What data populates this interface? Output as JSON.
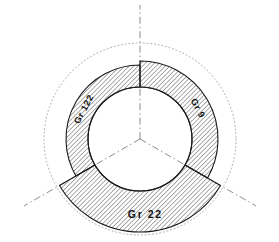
{
  "drawing": {
    "title": "Three-sector annular cross-section",
    "type": "engineering-cross-section",
    "canvas": {
      "width": 279,
      "height": 242,
      "background": "#ffffff"
    },
    "center": {
      "x": 140,
      "y": 139
    },
    "inner_radius": 52,
    "reference_circle": {
      "name": "dotted-reference-circle",
      "radius": 96,
      "style": "dotted",
      "color": "#999999"
    },
    "centerlines": {
      "name": "radial-centerlines",
      "style": "dash-dot",
      "color": "#777777",
      "count": 3,
      "angles_deg": [
        270,
        30,
        150
      ],
      "length": 134
    },
    "hatch": {
      "angle_deg": 45,
      "spacing": 3.2,
      "color": "#222222",
      "line_width": 0.75
    },
    "outline_color": "#1a1a1a",
    "sectors": [
      {
        "id": "sector-gr-122",
        "label": "Gr 122",
        "start_deg": 150,
        "end_deg": 270,
        "outer_radius": 74,
        "label_angle_deg": 208,
        "label_radius": 63,
        "label_rotation_deg": -62
      },
      {
        "id": "sector-gr-9",
        "label": "Gr 9",
        "start_deg": 270,
        "end_deg": 30,
        "outer_radius": 78,
        "label_angle_deg": 332,
        "label_radius": 65,
        "label_rotation_deg": 62
      },
      {
        "id": "sector-gr-22",
        "label": "Gr 22",
        "start_deg": 30,
        "end_deg": 150,
        "outer_radius": 93,
        "label_angle_deg": 86,
        "label_radius": 76,
        "label_rotation_deg": 0
      }
    ]
  }
}
